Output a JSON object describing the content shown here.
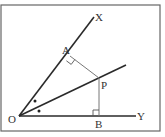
{
  "diagram": {
    "type": "geometry-angle-bisector",
    "colors": {
      "line": "#2a2a2a",
      "thin_line": "#777777",
      "frame": "#666666",
      "background": "#ffffff"
    },
    "labels": {
      "O": "O",
      "X": "X",
      "Y": "Y",
      "A": "A",
      "P": "P",
      "B": "B"
    },
    "points": {
      "O": [
        19,
        116
      ],
      "X_end": [
        94,
        17
      ],
      "Y_end": [
        136,
        116
      ],
      "bisector_end": [
        126,
        65
      ],
      "A": [
        70,
        56
      ],
      "P": [
        99,
        78
      ],
      "B": [
        99,
        116
      ]
    },
    "marks": {
      "right_angles": [
        "A",
        "B"
      ],
      "equal_angle_dots": 2
    }
  }
}
